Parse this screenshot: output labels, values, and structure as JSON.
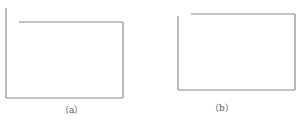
{
  "figure": {
    "panels": [
      {
        "id": "a",
        "caption": "（a）",
        "description": "open rectangle, top edge stops short of left edge, left edge extends above top edge"
      },
      {
        "id": "b",
        "caption": "（b）",
        "description": "open rectangle, top edge stops short of left edge"
      }
    ],
    "line_color": "#8a8a8a",
    "caption_color": "#555555"
  }
}
